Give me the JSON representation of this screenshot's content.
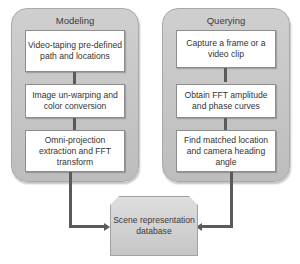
{
  "diagram": {
    "modeling": {
      "title": "Modeling",
      "steps": [
        "Video-taping pre-defined path and locations",
        "Image un-warping and color conversion",
        "Omni-projection extraction and FFT transform"
      ]
    },
    "querying": {
      "title": "Querying",
      "steps": [
        "Capture a frame or a video clip",
        "Obtain FFT amplitude and phase curves",
        "Find matched location and camera heading angle"
      ]
    },
    "database": {
      "label": "Scene representation database"
    },
    "colors": {
      "panel_fill": "#c8c8c8",
      "box_fill": "#ffffff",
      "connector": "#5a5a5a",
      "database_fill": "#d2d2d2"
    }
  }
}
